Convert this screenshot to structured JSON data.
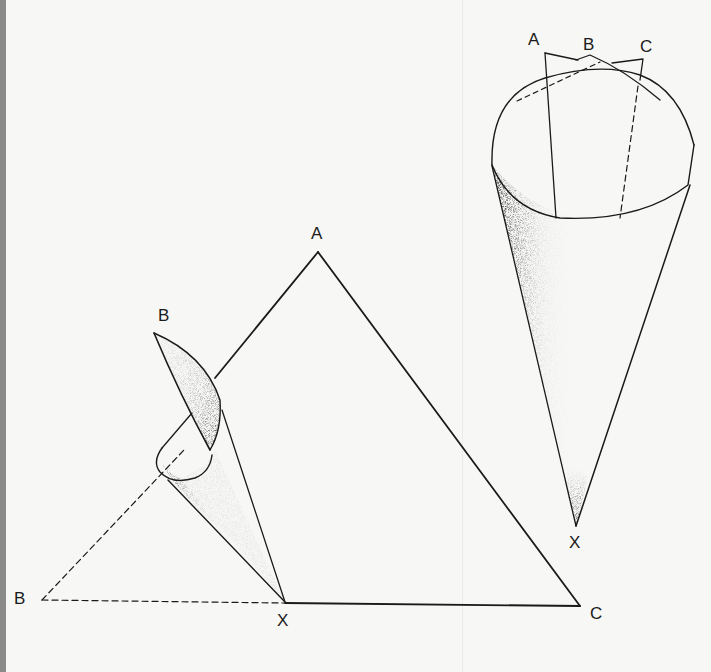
{
  "figure": {
    "type": "geometric-diagram",
    "colors": {
      "ink": "#1a1a1a",
      "paper": "#f7f7f5",
      "page_edge": "#8a8a88"
    },
    "left_diagram": {
      "labels": {
        "apex_a": "A",
        "curl_tip_b": "B",
        "flat_b": "B",
        "vertex_x": "X",
        "vertex_c": "C"
      }
    },
    "right_diagram": {
      "labels": {
        "rim_a": "A",
        "rim_b": "B",
        "rim_c": "C",
        "apex_x": "X"
      }
    }
  }
}
